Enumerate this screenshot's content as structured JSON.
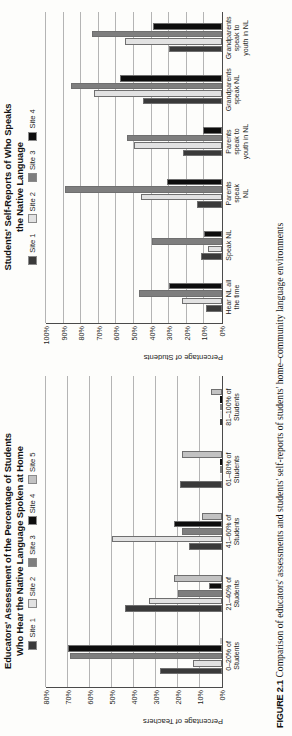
{
  "figure": {
    "caption_label": "FIGURE 2.1",
    "caption_text": "Comparison of educators' assessments and students' self-reports of students' home–community language environments"
  },
  "palette": {
    "site1": "#3a3a3a",
    "site2": "#e2e2e2",
    "site3": "#7e7e7e",
    "site4": "#0d0d0d",
    "site5": "#c2c2c2"
  },
  "left_chart": {
    "title_line1": "Educators' Assessment of the Percentage of Students",
    "title_line2": "Who Hear the Native Language Spoken at Home",
    "ylabel": "Percentage of Teachers",
    "legend": [
      {
        "label": "Site 1",
        "color": "#3a3a3a"
      },
      {
        "label": "Site 2",
        "color": "#e2e2e2"
      },
      {
        "label": "Site 3",
        "color": "#7e7e7e"
      },
      {
        "label": "Site 4",
        "color": "#0d0d0d"
      },
      {
        "label": "Site 5",
        "color": "#c2c2c2"
      }
    ],
    "yticks": [
      "0%",
      "10%",
      "20%",
      "30%",
      "40%",
      "50%",
      "60%",
      "70%",
      "80%"
    ],
    "categories": [
      "0–20% of\nStudents",
      "21–40% of\nStudents",
      "41–60% of\nStudents",
      "61–80% of\nStudents",
      "81–100% of\nStudents"
    ]
  },
  "right_chart": {
    "title_line1": "Students' Self-Reports of Who Speaks",
    "title_line2": "the Native Language",
    "ylabel": "Percentage of Students",
    "legend": [
      {
        "label": "Site 1",
        "color": "#3a3a3a"
      },
      {
        "label": "Site 2",
        "color": "#e2e2e2"
      },
      {
        "label": "Site 3",
        "color": "#7e7e7e"
      },
      {
        "label": "Site 4",
        "color": "#0d0d0d"
      }
    ],
    "yticks": [
      "0%",
      "10%",
      "20%",
      "30%",
      "40%",
      "50%",
      "60%",
      "70%",
      "80%",
      "90%",
      "100%"
    ],
    "categories": [
      "Hear NL all\nthe time",
      "Speak NL",
      "Parents\nspeak\nNL",
      "Parents\nspeak to\nyouth in NL",
      "Grandparents\nspeak NL",
      "Grandparents\nspeak to\nyouth in NL"
    ]
  },
  "chart_data": [
    {
      "type": "bar",
      "id": "educators-assessment",
      "title": "Educators' Assessment of the Percentage of Students Who Hear the Native Language Spoken at Home",
      "xlabel": "",
      "ylabel": "Percentage of Teachers",
      "ylim": [
        0,
        80
      ],
      "ytick_step": 10,
      "grid": true,
      "legend_position": "top-center",
      "categories": [
        "0–20% of Students",
        "21–40% of Students",
        "41–60% of Students",
        "61–80% of Students",
        "81–100% of Students"
      ],
      "series": [
        {
          "name": "Site 1",
          "color": "#3a3a3a",
          "values": [
            28,
            44,
            15,
            19,
            0
          ]
        },
        {
          "name": "Site 2",
          "color": "#e2e2e2",
          "values": [
            13,
            33,
            50,
            0,
            0
          ]
        },
        {
          "name": "Site 3",
          "color": "#7e7e7e",
          "values": [
            69,
            20,
            18,
            0,
            0
          ]
        },
        {
          "name": "Site 4",
          "color": "#0d0d0d",
          "values": [
            70,
            6,
            22,
            0,
            0
          ]
        },
        {
          "name": "Site 5",
          "color": "#c2c2c2",
          "values": [
            0,
            22,
            9,
            18,
            5
          ]
        }
      ]
    },
    {
      "type": "bar",
      "id": "students-self-reports",
      "title": "Students' Self-Reports of Who Speaks the Native Language",
      "xlabel": "",
      "ylabel": "Percentage of Students",
      "ylim": [
        0,
        100
      ],
      "ytick_step": 10,
      "grid": true,
      "legend_position": "top-center",
      "categories": [
        "Hear NL all the time",
        "Speak NL",
        "Parents speak NL",
        "Parents speak to youth in NL",
        "Grandparents speak NL",
        "Grandparents speak to youth in NL"
      ],
      "series": [
        {
          "name": "Site 1",
          "color": "#3a3a3a",
          "values": [
            9,
            12,
            14,
            22,
            45,
            30
          ]
        },
        {
          "name": "Site 2",
          "color": "#e2e2e2",
          "values": [
            23,
            8,
            46,
            50,
            73,
            55
          ]
        },
        {
          "name": "Site 3",
          "color": "#7e7e7e",
          "values": [
            47,
            40,
            89,
            54,
            86,
            74
          ]
        },
        {
          "name": "Site 4",
          "color": "#0d0d0d",
          "values": [
            30,
            10,
            31,
            11,
            58,
            39
          ]
        }
      ]
    }
  ]
}
